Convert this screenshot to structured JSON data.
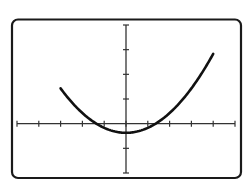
{
  "chart_data": {
    "type": "line",
    "title": "",
    "xlabel": "",
    "ylabel": "",
    "xlim": [
      -5,
      5
    ],
    "ylim": [
      -2,
      4
    ],
    "x_ticks": [
      -5,
      -4,
      -3,
      -2,
      -1,
      0,
      1,
      2,
      3,
      4,
      5
    ],
    "y_ticks": [
      -2,
      -1,
      0,
      1,
      2,
      3,
      4
    ],
    "tick_labels_shown": false,
    "grid": false,
    "legend": null,
    "series": [
      {
        "name": "parabola",
        "equation_estimate": "y = 0.2x^2 - 0.37",
        "coefficients": {
          "a": 0.2,
          "b": 0,
          "c": -0.37
        },
        "x_range": [
          -3,
          4
        ],
        "x": [
          -3,
          -2.5,
          -2,
          -1.5,
          -1,
          -0.5,
          0,
          0.5,
          1,
          1.5,
          2,
          2.5,
          3,
          3.5,
          4
        ],
        "values": [
          1.43,
          0.88,
          0.43,
          0.08,
          -0.17,
          -0.32,
          -0.37,
          -0.32,
          -0.17,
          0.08,
          0.43,
          0.88,
          1.43,
          2.08,
          2.83
        ],
        "vertex": [
          0,
          -0.37
        ],
        "x_intercepts": [
          -1.36,
          1.36
        ],
        "color": "#111111"
      }
    ]
  },
  "colors": {
    "background": "#ffffff",
    "frame": "#1a1a1a",
    "axes": "#333333",
    "curve": "#111111"
  }
}
